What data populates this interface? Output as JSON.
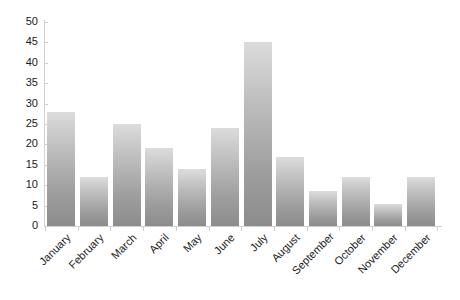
{
  "chart_data": {
    "type": "bar",
    "title": "",
    "subtitle": "",
    "xlabel": "",
    "ylabel": "",
    "categories": [
      "January",
      "February",
      "March",
      "April",
      "May",
      "June",
      "July",
      "August",
      "September",
      "October",
      "November",
      "December"
    ],
    "values": [
      28,
      12,
      25,
      19,
      14,
      24,
      45,
      17,
      8.5,
      12,
      5.5,
      12
    ],
    "ylim": [
      0,
      50
    ],
    "y_ticks": [
      0,
      5,
      10,
      15,
      20,
      25,
      30,
      35,
      40,
      45,
      50
    ],
    "y_tick_labels": [
      "0",
      "5",
      "10",
      "15",
      "20",
      "25",
      "30",
      "35",
      "40",
      "45",
      "50"
    ],
    "grid": false,
    "legend": false,
    "legend_position": "none",
    "x_tick_rotation": -45,
    "bar_color_top": "#dcdcdc",
    "bar_color_bottom": "#8c8c8c",
    "axis_color": "#cfcfcf",
    "text_color": "#1a1a1a",
    "background_color": "#ffffff"
  }
}
